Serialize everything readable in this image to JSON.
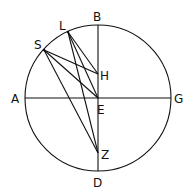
{
  "diagram": {
    "circle": {
      "cx": 98,
      "cy": 98,
      "r": 73
    },
    "points": {
      "A": {
        "x": 25,
        "y": 98
      },
      "G": {
        "x": 171,
        "y": 98
      },
      "B": {
        "x": 98,
        "y": 25
      },
      "D": {
        "x": 98,
        "y": 171
      },
      "E": {
        "x": 98,
        "y": 98
      },
      "L": {
        "x": 68,
        "y": 32
      },
      "S": {
        "x": 44,
        "y": 50
      },
      "H": {
        "x": 98,
        "y": 74
      },
      "Z": {
        "x": 98,
        "y": 153
      }
    },
    "labels": {
      "A": "A",
      "B": "B",
      "G": "G",
      "D": "D",
      "E": "E",
      "L": "L",
      "S": "S",
      "H": "H",
      "Z": "Z"
    },
    "segments": [
      [
        "A",
        "G"
      ],
      [
        "B",
        "D"
      ],
      [
        "L",
        "H"
      ],
      [
        "L",
        "E"
      ],
      [
        "L",
        "Z"
      ],
      [
        "S",
        "H"
      ],
      [
        "S",
        "E"
      ],
      [
        "S",
        "Z"
      ]
    ],
    "stroke_color": "#111111"
  }
}
